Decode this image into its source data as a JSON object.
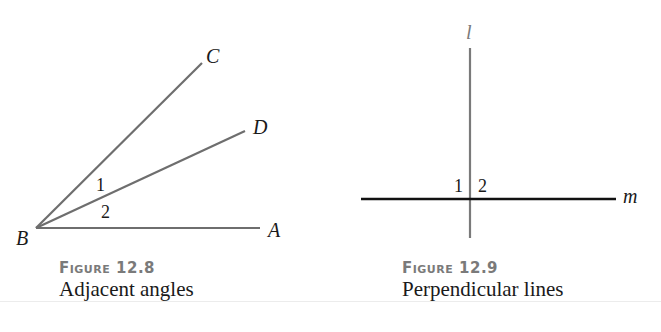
{
  "figures": [
    {
      "number_label": "Figure 12.8",
      "caption": "Adjacent angles",
      "points": {
        "B": "B",
        "A": "A",
        "C": "C",
        "D": "D"
      },
      "angle_labels": [
        "1",
        "2"
      ],
      "colors": {
        "rays": "#6e6e6e"
      }
    },
    {
      "number_label": "Figure 12.9",
      "caption": "Perpendicular lines",
      "lines": {
        "l": "l",
        "m": "m"
      },
      "angle_labels": [
        "1",
        "2"
      ],
      "colors": {
        "line_l": "#7a7a7a",
        "line_m": "#111111"
      }
    }
  ]
}
